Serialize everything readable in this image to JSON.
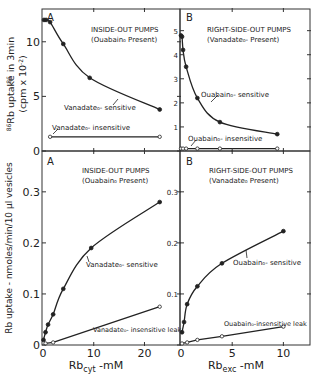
{
  "figure": {
    "top_ylabel_line1": "86Rb uptake in 3min",
    "top_ylabel_line2": "(cpm x 10-2)",
    "bottom_ylabel": "Rb uptake - nmoles/min/10 µl vesicles",
    "bottom_xlabel_a": "Rb",
    "bottom_xlabel_a_sub": "cyt",
    "bottom_xlabel_a_unit": " -mM",
    "bottom_xlabel_b": "Rb",
    "bottom_xlabel_b_sub": "exc",
    "bottom_xlabel_b_unit": " -mM"
  },
  "chart_data": [
    {
      "panel": "top-A",
      "type": "line",
      "label": "A",
      "title": "INSIDE-OUT PUMPS",
      "subtitle": "(Ouabain₀ Present)",
      "xlabel": "Rb_cyt -mM",
      "ylabel": "86Rb uptake in 3min (cpm x 10^-2)",
      "xlim": [
        0,
        27
      ],
      "ylim": [
        0,
        13
      ],
      "yticks": [
        0,
        5,
        10
      ],
      "series": [
        {
          "name": "Vanadate₀- sensitive",
          "marker": "filled",
          "x": [
            0.2,
            0.6,
            1.4,
            4,
            9.2,
            23
          ],
          "y": [
            12.0,
            12.0,
            11.8,
            9.8,
            6.7,
            3.8
          ]
        },
        {
          "name": "Vanadate₀- insensitive",
          "marker": "open",
          "x": [
            1.4,
            23
          ],
          "y": [
            1.3,
            1.3
          ]
        }
      ]
    },
    {
      "panel": "top-B",
      "type": "line",
      "label": "B",
      "title": "RIGHT-SIDE-OUT PUMPS",
      "subtitle": "(Vanadate₀- Present)",
      "xlabel": "Rb_exc -mM",
      "ylabel": "86Rb uptake in 3min (cpm x 10^-2)",
      "xlim": [
        0,
        12.6
      ],
      "ylim": [
        0,
        5.9
      ],
      "yticks": [
        1,
        2,
        3,
        4,
        5
      ],
      "series": [
        {
          "name": "Ouabain₀- sensitive",
          "marker": "filled",
          "x": [
            0,
            0.1,
            0.2,
            0.5,
            1.6,
            3.8,
            9.4
          ],
          "y": [
            4.8,
            4.75,
            4.2,
            3.5,
            2.2,
            1.2,
            0.7
          ]
        },
        {
          "name": "Ouabain₀- insensitive",
          "marker": "open",
          "x": [
            0,
            0.2,
            0.5,
            1.6,
            3.8,
            9.4
          ],
          "y": [
            0.1,
            0.1,
            0.1,
            0.1,
            0.1,
            0.1
          ]
        }
      ]
    },
    {
      "panel": "bottom-A",
      "type": "line",
      "label": "A",
      "title": "INSIDE-OUT PUMPS",
      "subtitle": "(Ouabain₀ Present)",
      "xlabel": "Rb_cyt -mM",
      "ylabel": "Rb uptake - nmoles/min/10 µl vesicles",
      "xlim": [
        0,
        27
      ],
      "ylim": [
        0,
        0.38
      ],
      "xticks": [
        0,
        10,
        20
      ],
      "yticks": [
        0,
        0.1,
        0.2,
        0.3
      ],
      "series": [
        {
          "name": "Vanadate₀- sensitive",
          "marker": "filled",
          "x": [
            0.1,
            0.5,
            1,
            2,
            4,
            9.5,
            23
          ],
          "y": [
            0.01,
            0.025,
            0.04,
            0.06,
            0.11,
            0.19,
            0.28
          ]
        },
        {
          "name": "Vanadate₀- insensitive leak",
          "marker": "open",
          "x": [
            0.5,
            2,
            23
          ],
          "y": [
            0.003,
            0.005,
            0.075
          ]
        }
      ]
    },
    {
      "panel": "bottom-B",
      "type": "line",
      "label": "B",
      "title": "RIGHT-SIDE-OUT PUMPS",
      "subtitle": "(Vanadate₀ Present)",
      "xlabel": "Rb_exc -mM",
      "ylabel": "Rb uptake - nmoles/min/10 µl vesicles",
      "xlim": [
        0,
        12.6
      ],
      "ylim": [
        0,
        0.38
      ],
      "xticks": [
        0,
        5,
        10
      ],
      "yticks": [
        0.1,
        0.2,
        0.3
      ],
      "series": [
        {
          "name": "Ouabain₀- sensitive",
          "marker": "filled",
          "x": [
            0.1,
            0.3,
            0.6,
            1.6,
            4,
            10
          ],
          "y": [
            0.025,
            0.045,
            0.08,
            0.115,
            0.16,
            0.223
          ]
        },
        {
          "name": "Ouabain₀-insensitive leak",
          "marker": "open",
          "x": [
            0.1,
            0.6,
            1.6,
            4,
            10
          ],
          "y": [
            0.003,
            0.005,
            0.01,
            0.017,
            0.036
          ]
        }
      ]
    }
  ],
  "tick_labels": {
    "topA_y": [
      "0",
      "5",
      "10"
    ],
    "topB_y": [
      "1",
      "2",
      "3",
      "4",
      "5"
    ],
    "botA_y": [
      "0",
      "0.1",
      "0.2",
      "0.3"
    ],
    "botB_y": [
      "0.1",
      "0.2",
      "0.3"
    ],
    "botA_x": [
      "0",
      "10",
      "20"
    ],
    "botB_x": [
      "0",
      "5",
      "10"
    ]
  },
  "annotations": {
    "topA_label": "A",
    "topA_title": "INSIDE-OUT PUMPS",
    "topA_subtitle": "(Ouabain₀ Present)",
    "topA_s1": "Vanadate₀- sensitive",
    "topA_s2": "Vanadate₀- insensitive",
    "topB_label": "B",
    "topB_title": "RIGHT-SIDE-OUT PUMPS",
    "topB_subtitle": "(Vanadate₀- Present)",
    "topB_s1": "Ouabain₀- sensitive",
    "topB_s2": "Ouabain₀- insensitive",
    "botA_label": "A",
    "botA_title": "INSIDE-OUT PUMPS",
    "botA_subtitle": "(Ouabain₀ Present)",
    "botA_s1": "Vanadate₀- sensitive",
    "botA_s2": "Vanadate₀- insensitive leak",
    "botB_label": "B",
    "botB_title": "RIGHT-SIDE-OUT PUMPS",
    "botB_subtitle": "(Vanadate₀ Present)",
    "botB_s1": "Ouabain₀- sensitive",
    "botB_s2": "Ouabain₀-insensitive leak"
  }
}
